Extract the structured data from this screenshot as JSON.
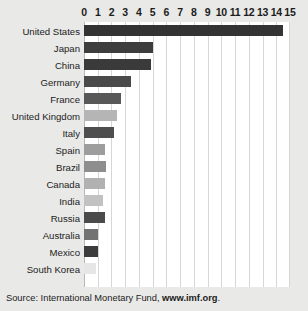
{
  "source_note": {
    "prefix": "Source: International Monetary Fund, ",
    "link": "www.imf.org",
    "suffix": "."
  },
  "colors": {
    "background": "#e9e9e7",
    "plot_background": "#ffffff",
    "gridline": "#d6d6d4",
    "axis": "#b8b8b6",
    "text": "#1c1c1c"
  },
  "chart_data": {
    "type": "bar",
    "orientation": "horizontal",
    "title": "",
    "subtitle": "",
    "xlabel": "",
    "ylabel": "",
    "xlim": [
      0,
      15
    ],
    "grid": true,
    "legend": "none",
    "xticks": [
      0,
      1,
      2,
      3,
      4,
      5,
      6,
      7,
      8,
      9,
      10,
      11,
      12,
      13,
      14,
      15
    ],
    "xtick_labels": [
      "0",
      "1",
      "2",
      "3",
      "4",
      "5",
      "6",
      "7",
      "8",
      "9",
      "10",
      "11",
      "12",
      "13",
      "14",
      "15"
    ],
    "categories": [
      "United States",
      "Japan",
      "China",
      "Germany",
      "France",
      "United Kingdom",
      "Italy",
      "Spain",
      "Brazil",
      "Canada",
      "India",
      "Russia",
      "Australia",
      "Mexico",
      "South Korea"
    ],
    "values": [
      14.5,
      5.0,
      4.9,
      3.4,
      2.7,
      2.4,
      2.2,
      1.5,
      1.6,
      1.5,
      1.4,
      1.5,
      1.0,
      1.0,
      0.9
    ],
    "bar_colors": [
      "#333333",
      "#3d3d3d",
      "#3a3a3a",
      "#4a4a4a",
      "#585858",
      "#b5b5b5",
      "#4e4e4e",
      "#9d9d9d",
      "#8e8e8e",
      "#b1b1b1",
      "#c2c2c2",
      "#4b4b4b",
      "#737373",
      "#3c3c3c",
      "#e6e6e6"
    ]
  }
}
